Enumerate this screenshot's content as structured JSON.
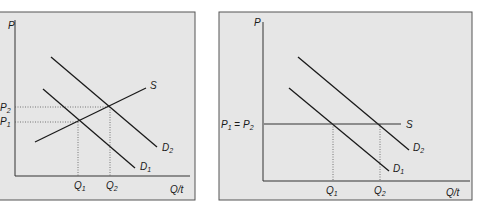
{
  "colors": {
    "panel_bg": "#e6e6e6",
    "frame": "#555555",
    "line": "#1a1a1a",
    "dotted": "#555555"
  },
  "left_panel": {
    "y_axis_label": "P",
    "x_axis_label": "Q/t",
    "price_labels": [
      {
        "base": "P",
        "sub": "2"
      },
      {
        "base": "P",
        "sub": "1"
      }
    ],
    "quantity_labels": [
      {
        "base": "Q",
        "sub": "1"
      },
      {
        "base": "Q",
        "sub": "2"
      }
    ],
    "curves": {
      "supply": "S",
      "demand_1": {
        "base": "D",
        "sub": "1"
      },
      "demand_2": {
        "base": "D",
        "sub": "2"
      }
    }
  },
  "right_panel": {
    "y_axis_label": "P",
    "x_axis_label": "Q/t",
    "price_label": {
      "base1": "P",
      "sub1": "1",
      "eq": " = ",
      "base2": "P",
      "sub2": "2"
    },
    "quantity_labels": [
      {
        "base": "Q",
        "sub": "1"
      },
      {
        "base": "Q",
        "sub": "2"
      }
    ],
    "curves": {
      "supply": "S",
      "demand_1": {
        "base": "D",
        "sub": "1"
      },
      "demand_2": {
        "base": "D",
        "sub": "2"
      }
    }
  }
}
